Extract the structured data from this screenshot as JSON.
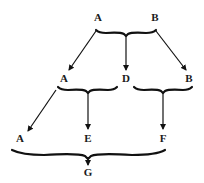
{
  "diagram": {
    "type": "derivation-tree",
    "nodes": {
      "top_left": "A",
      "top_right": "B",
      "mid_left": "A",
      "mid_center": "D",
      "mid_right": "B",
      "bottom_left": "A",
      "bottom_center": "E",
      "bottom_right": "F",
      "root": "G"
    },
    "edges": [
      {
        "from": [
          "A",
          "B"
        ],
        "to": [
          "A",
          "D",
          "B"
        ]
      },
      {
        "from": [
          "A",
          "D"
        ],
        "to": [
          "A",
          "E"
        ]
      },
      {
        "from": [
          "B"
        ],
        "to": [
          "F"
        ]
      },
      {
        "from": [
          "A",
          "E",
          "F"
        ],
        "to": [
          "G"
        ]
      }
    ],
    "colors": {
      "ink": "#111111",
      "background": "#ffffff"
    }
  }
}
